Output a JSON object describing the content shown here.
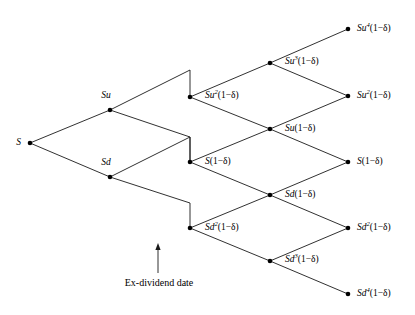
{
  "figure": {
    "type": "binomial-lattice-diagram",
    "title": "",
    "background_color": "#ffffff",
    "line_color": "#1a1a1a",
    "node_color": "#000000",
    "width": 415,
    "height": 315
  },
  "nodes": [
    {
      "id": "n0",
      "label_html": "S",
      "label_text": "S",
      "x": 30,
      "y": 143,
      "label_x": 21,
      "label_y": 143,
      "anchor": "right"
    },
    {
      "id": "nu",
      "label_html": "Su",
      "label_text": "Su",
      "x": 110,
      "y": 110,
      "label_x": 106,
      "label_y": 96,
      "anchor": "center"
    },
    {
      "id": "nd",
      "label_html": "Sd",
      "label_text": "Sd",
      "x": 110,
      "y": 177,
      "label_x": 106,
      "label_y": 163,
      "anchor": "center"
    },
    {
      "id": "m2u",
      "label_html": "Su<sup>2</sup><span class=\"upright\">(1&minus;&delta;)</span>",
      "label_text": "Su2(1-d)",
      "x": 190,
      "y": 97,
      "label_x": 205,
      "label_y": 96,
      "anchor": "left"
    },
    {
      "id": "m0",
      "label_html": "S<span class=\"upright\">(1&minus;&delta;)</span>",
      "label_text": "S(1-d)",
      "x": 190,
      "y": 162,
      "label_x": 205,
      "label_y": 162,
      "anchor": "left"
    },
    {
      "id": "m2d",
      "label_html": "Sd<sup>2</sup><span class=\"upright\">(1&minus;&delta;)</span>",
      "label_text": "Sd2(1-d)",
      "x": 190,
      "y": 228,
      "label_x": 205,
      "label_y": 228,
      "anchor": "left"
    },
    {
      "id": "r3u",
      "label_html": "Su<sup>3</sup><span class=\"upright\">(1&minus;&delta;)</span>",
      "label_text": "Su3(1-d)",
      "x": 270,
      "y": 63,
      "label_x": 285,
      "label_y": 62,
      "anchor": "left"
    },
    {
      "id": "r1u",
      "label_html": "Su<span class=\"upright\">(1&minus;&delta;)</span>",
      "label_text": "Su(1-d)",
      "x": 270,
      "y": 129,
      "label_x": 285,
      "label_y": 129,
      "anchor": "left"
    },
    {
      "id": "r1d",
      "label_html": "Sd<span class=\"upright\">(1&minus;&delta;)</span>",
      "label_text": "Sd(1-d)",
      "x": 270,
      "y": 195,
      "label_x": 285,
      "label_y": 195,
      "anchor": "left"
    },
    {
      "id": "r3d",
      "label_html": "Sd<sup>3</sup><span class=\"upright\">(1&minus;&delta;)</span>",
      "label_text": "Sd3(1-d)",
      "x": 270,
      "y": 261,
      "label_x": 285,
      "label_y": 260,
      "anchor": "left"
    },
    {
      "id": "t4u",
      "label_html": "Su<sup>4</sup><span class=\"upright\">(1&minus;&delta;)</span>",
      "label_text": "Su4(1-d)",
      "x": 348,
      "y": 29,
      "label_x": 357,
      "label_y": 29,
      "anchor": "left"
    },
    {
      "id": "t2u",
      "label_html": "Su<sup>2</sup><span class=\"upright\">(1&minus;&delta;)</span>",
      "label_text": "Su2(1-d)",
      "x": 348,
      "y": 96,
      "label_x": 357,
      "label_y": 96,
      "anchor": "left"
    },
    {
      "id": "t0",
      "label_html": "S<span class=\"upright\">(1&minus;&delta;)</span>",
      "label_text": "S(1-d)",
      "x": 348,
      "y": 162,
      "label_x": 357,
      "label_y": 162,
      "anchor": "left"
    },
    {
      "id": "t2d",
      "label_html": "Sd<sup>2</sup><span class=\"upright\">(1&minus;&delta;)</span>",
      "label_text": "Sd2(1-d)",
      "x": 348,
      "y": 228,
      "label_x": 357,
      "label_y": 228,
      "anchor": "left"
    },
    {
      "id": "t4d",
      "label_html": "Sd<sup>4</sup><span class=\"upright\">(1&minus;&delta;)</span>",
      "label_text": "Sd4(1-d)",
      "x": 348,
      "y": 294,
      "label_x": 357,
      "label_y": 294,
      "anchor": "left"
    }
  ],
  "edges": [
    {
      "from": "n0",
      "to": "nu",
      "points": "30,143 110,110"
    },
    {
      "from": "n0",
      "to": "nd",
      "points": "30,143 110,177"
    },
    {
      "from": "nu",
      "to": "m2u",
      "points": "110,110 190,70 190,97"
    },
    {
      "from": "nu",
      "to": "m0",
      "points": "110,110 190,137 190,162"
    },
    {
      "from": "nd",
      "to": "m0",
      "points": "110,177 190,137 190,162"
    },
    {
      "from": "nd",
      "to": "m2d",
      "points": "110,177 190,203 190,228"
    },
    {
      "from": "m2u",
      "to": "r3u",
      "points": "190,97 270,63"
    },
    {
      "from": "m2u",
      "to": "r1u",
      "points": "190,97 270,129"
    },
    {
      "from": "m0",
      "to": "r1u",
      "points": "190,162 270,129"
    },
    {
      "from": "m0",
      "to": "r1d",
      "points": "190,162 270,195"
    },
    {
      "from": "m2d",
      "to": "r1d",
      "points": "190,228 270,195"
    },
    {
      "from": "m2d",
      "to": "r3d",
      "points": "190,228 270,261"
    },
    {
      "from": "r3u",
      "to": "t4u",
      "points": "270,63 348,29"
    },
    {
      "from": "r3u",
      "to": "t2u",
      "points": "270,63 348,96"
    },
    {
      "from": "r1u",
      "to": "t2u",
      "points": "270,129 348,96"
    },
    {
      "from": "r1u",
      "to": "t0",
      "points": "270,129 348,162"
    },
    {
      "from": "r1d",
      "to": "t0",
      "points": "270,195 348,162"
    },
    {
      "from": "r1d",
      "to": "t2d",
      "points": "270,195 348,228"
    },
    {
      "from": "r3d",
      "to": "t2d",
      "points": "270,261 348,228"
    },
    {
      "from": "r3d",
      "to": "t4d",
      "points": "270,261 348,294"
    }
  ],
  "annotations": [
    {
      "id": "ex-dividend",
      "text": "Ex-dividend date",
      "text_x": 159,
      "text_y": 283,
      "arrow": {
        "x": 158,
        "y_tail": 273,
        "y_head": 243
      }
    }
  ]
}
